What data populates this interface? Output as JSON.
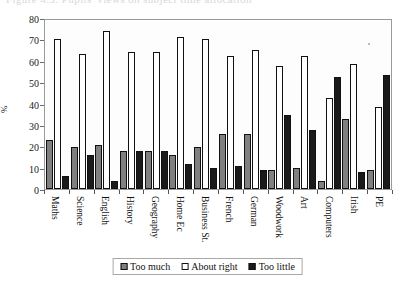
{
  "figure": {
    "clipped_title": "Figure 4.3: Pupils' views on subject time allocation",
    "y_axis_label": "%"
  },
  "chart_data": {
    "type": "bar",
    "title": "",
    "xlabel": "",
    "ylabel": "%",
    "ylim": [
      0,
      80
    ],
    "yticks": [
      0,
      10,
      20,
      30,
      40,
      50,
      60,
      70,
      80
    ],
    "grid": false,
    "legend_position": "bottom-center",
    "categories": [
      "Maths",
      "Science",
      "English",
      "History",
      "Geography",
      "Home Ec",
      "Business St.",
      "French",
      "German",
      "Woodwork",
      "Art",
      "Computers",
      "Irish",
      "PE"
    ],
    "series": [
      {
        "name": "Too much",
        "color": "#808080",
        "values": [
          23,
          20,
          21,
          18,
          18,
          16,
          20,
          26,
          26,
          9,
          10,
          4,
          33,
          9
        ]
      },
      {
        "name": "About right",
        "color": "#ffffff",
        "values": [
          71,
          64,
          75,
          65,
          65,
          72,
          71,
          63,
          66,
          58,
          63,
          43,
          59,
          39
        ]
      },
      {
        "name": "Too little",
        "color": "#1a1a1a",
        "values": [
          6,
          16,
          4,
          18,
          18,
          12,
          10,
          11,
          9,
          35,
          28,
          53,
          8,
          54
        ]
      }
    ]
  }
}
